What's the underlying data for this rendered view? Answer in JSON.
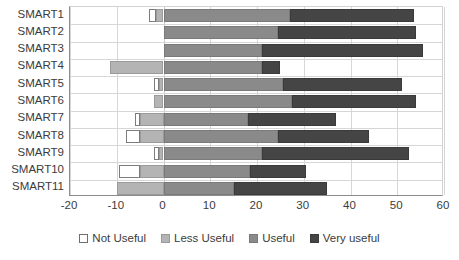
{
  "chart_data": {
    "type": "bar",
    "orientation": "horizontal",
    "stacked": true,
    "diverging": true,
    "title": "",
    "xlabel": "",
    "ylabel": "",
    "xlim": [
      -20,
      60
    ],
    "xticks": [
      -20,
      -10,
      0,
      10,
      20,
      30,
      40,
      50,
      60
    ],
    "xtick_labels": [
      "-20",
      "-10",
      "0",
      "10",
      "20",
      "30",
      "40",
      "50",
      "60"
    ],
    "grid": true,
    "legend_position": "bottom",
    "categories": [
      "SMART1",
      "SMART2",
      "SMART3",
      "SMART4",
      "SMART5",
      "SMART6",
      "SMART7",
      "SMART8",
      "SMART9",
      "SMART10",
      "SMART11"
    ],
    "series": [
      {
        "name": "Not Useful",
        "color": "#ffffff",
        "values": [
          1.5,
          0,
          0,
          0,
          1,
          0,
          1,
          3,
          1,
          4.5,
          0
        ]
      },
      {
        "name": "Less Useful",
        "color": "#b4b4b4",
        "values": [
          1.5,
          0,
          0,
          11.5,
          1,
          2,
          5,
          5,
          1,
          5,
          10
        ]
      },
      {
        "name": "Useful",
        "color": "#8a8a8a",
        "values": [
          27,
          24.5,
          21,
          21,
          25.5,
          27.5,
          18,
          24.5,
          21,
          18.5,
          15
        ]
      },
      {
        "name": "Very useful",
        "color": "#454545",
        "values": [
          26.5,
          29.5,
          34.5,
          4,
          25.5,
          26.5,
          19,
          19.5,
          31.5,
          12,
          20
        ]
      }
    ],
    "bar_totals_negative": [
      -3,
      0,
      0,
      -11.5,
      -2,
      -2,
      -6,
      -8,
      -2,
      -9.5,
      -10
    ],
    "bar_totals_positive": [
      53.5,
      54,
      55.5,
      25,
      51,
      54,
      37,
      44,
      52.5,
      30.5,
      35
    ]
  },
  "legend": {
    "items": [
      {
        "label": "Not Useful",
        "key": "notuseful"
      },
      {
        "label": "Less Useful",
        "key": "lessuseful"
      },
      {
        "label": "Useful",
        "key": "useful"
      },
      {
        "label": "Very useful",
        "key": "veryuseful"
      }
    ]
  },
  "colors": {
    "not_useful": "#ffffff",
    "less_useful": "#b4b4b4",
    "useful": "#8a8a8a",
    "very_useful": "#454545",
    "grid": "#d6d6d6",
    "axis": "#8c8c8c",
    "text": "#3b3b3b"
  }
}
